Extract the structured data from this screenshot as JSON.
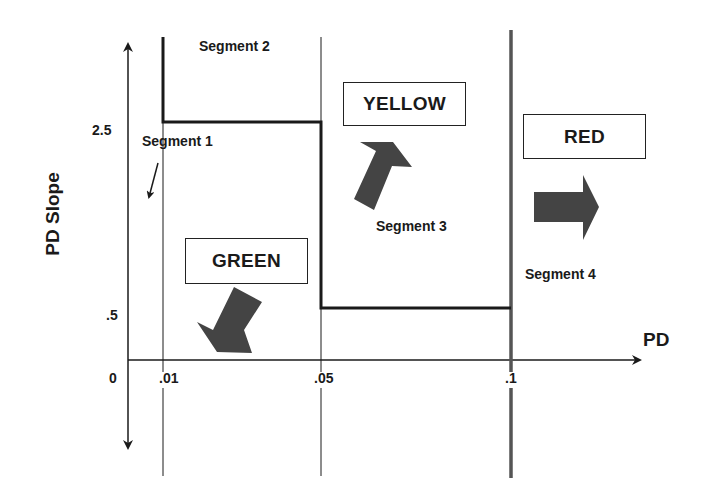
{
  "diagram": {
    "x_axis_label": "PD",
    "y_axis_label": "PD Slope",
    "x_ticks": [
      ".01",
      ".05",
      ".1"
    ],
    "y_ticks": [
      "2.5",
      ".5"
    ],
    "origin_label": "0",
    "segments": [
      {
        "label": "Segment 1"
      },
      {
        "label": "Segment 2"
      },
      {
        "label": "Segment 3"
      },
      {
        "label": "Segment 4"
      }
    ],
    "zones": [
      {
        "label": "GREEN",
        "arrow": "down-left"
      },
      {
        "label": "YELLOW",
        "arrow": "up-right"
      },
      {
        "label": "RED",
        "arrow": "right"
      }
    ],
    "colors": {
      "line": "#1a1a1a",
      "thick_line": "#555555",
      "arrow_fill": "#444444",
      "background": "#ffffff"
    }
  }
}
